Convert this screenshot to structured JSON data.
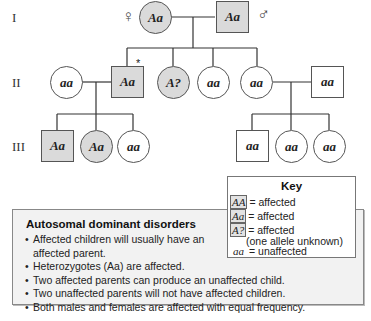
{
  "generations": [
    {
      "label": "I"
    },
    {
      "label": "II"
    },
    {
      "label": "III"
    }
  ],
  "colors": {
    "affected_fill": "#dadada",
    "unaffected_fill": "#ffffff",
    "outline": "#555555",
    "info_box_bg": "#f2f2f2"
  },
  "symbols": {
    "female": "♀",
    "male": "♂",
    "proband_marker": "*"
  },
  "pedigree": {
    "gen1": [
      {
        "id": "I-1",
        "sex": "female",
        "genotype": "Aa",
        "affected": true
      },
      {
        "id": "I-2",
        "sex": "male",
        "genotype": "Aa",
        "affected": true
      }
    ],
    "gen2": [
      {
        "id": "II-1",
        "sex": "female",
        "genotype": "aa",
        "affected": false
      },
      {
        "id": "II-2",
        "sex": "male",
        "genotype": "Aa",
        "affected": true,
        "marked": true
      },
      {
        "id": "II-3",
        "sex": "female",
        "genotype": "A?",
        "affected": true
      },
      {
        "id": "II-4",
        "sex": "female",
        "genotype": "aa",
        "affected": false
      },
      {
        "id": "II-5",
        "sex": "female",
        "genotype": "aa",
        "affected": false
      },
      {
        "id": "II-6",
        "sex": "male",
        "genotype": "aa",
        "affected": false
      }
    ],
    "gen3": [
      {
        "id": "III-1",
        "sex": "male",
        "genotype": "Aa",
        "affected": true
      },
      {
        "id": "III-2",
        "sex": "female",
        "genotype": "Aa",
        "affected": true
      },
      {
        "id": "III-3",
        "sex": "female",
        "genotype": "aa",
        "affected": false
      },
      {
        "id": "III-4",
        "sex": "male",
        "genotype": "aa",
        "affected": false
      },
      {
        "id": "III-5",
        "sex": "female",
        "genotype": "aa",
        "affected": false
      },
      {
        "id": "III-6",
        "sex": "female",
        "genotype": "aa",
        "affected": false
      }
    ]
  },
  "key": {
    "title": "Key",
    "rows": [
      {
        "swatch": "AA",
        "text": "= affected"
      },
      {
        "swatch": "Aa",
        "text": "= affected"
      },
      {
        "swatch": "A?",
        "text": "= affected"
      }
    ],
    "note": "(one allele unknown)",
    "unaffected": {
      "swatch": "aa",
      "text": "= unaffected"
    }
  },
  "info": {
    "title": "Autosomal dominant disorders",
    "bullet": "•",
    "items": [
      "Affected children will usually have an affected parent.",
      "Heterozygotes (Aa) are affected.",
      "Two affected parents can produce an unaffected child.",
      "Two unaffected parents will not have affected children.",
      "Both males and females are affected with equal frequency."
    ]
  }
}
